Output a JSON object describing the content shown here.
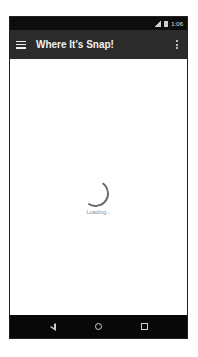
{
  "status_bar": {
    "time": "1:06",
    "icons": [
      "signal-icon",
      "battery-icon"
    ]
  },
  "toolbar": {
    "title": "Where It's Snap!",
    "menu_icon": "hamburger-menu-icon",
    "overflow_icon": "more-vert-icon"
  },
  "content": {
    "loading_text": "Loading..."
  },
  "nav_bar": {
    "buttons": [
      "back",
      "home",
      "recents"
    ]
  },
  "colors": {
    "toolbar": "#2b2b2b",
    "status_bar": "#0d0d0d",
    "nav_bar": "#080808",
    "spinner": "#6a6a6a"
  }
}
